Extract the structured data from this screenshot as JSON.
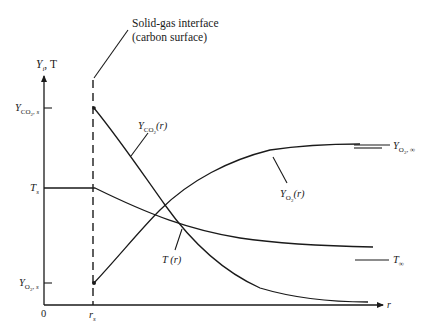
{
  "diagram": {
    "annotation": {
      "line1": "Solid-gas interface",
      "line2": "(carbon surface)"
    },
    "y_axis_label": {
      "main": "Y",
      "sub": "i",
      "rest": ", T"
    },
    "x_axis_label": "r",
    "origin_label": "0",
    "rs_label": {
      "main": "r",
      "sub": "s"
    },
    "left_labels": {
      "yco2s": {
        "main": "Y",
        "sub": "CO",
        "sub2": "2",
        "sub_rest": ", s"
      },
      "ts": {
        "main": "T",
        "sub": "s"
      },
      "yo2s": {
        "main": "Y",
        "sub": "O",
        "sub2": "2",
        "sub_rest": ", s"
      }
    },
    "curve_labels": {
      "yco2": {
        "main": "Y",
        "sub": "CO",
        "sub2": "2",
        "rest": "(r)"
      },
      "yo2": {
        "main": "Y",
        "sub": "O",
        "sub2": "2",
        "rest": "(r)"
      },
      "t": {
        "text": "T (r)"
      }
    },
    "right_labels": {
      "yo2inf": {
        "main": "Y",
        "sub": "O",
        "sub2": "2",
        "sub_rest": ", ∞"
      },
      "tinf": {
        "main": "T",
        "sub": "∞"
      }
    },
    "colors": {
      "ink": "#1a1a1a",
      "background": "#ffffff"
    }
  }
}
